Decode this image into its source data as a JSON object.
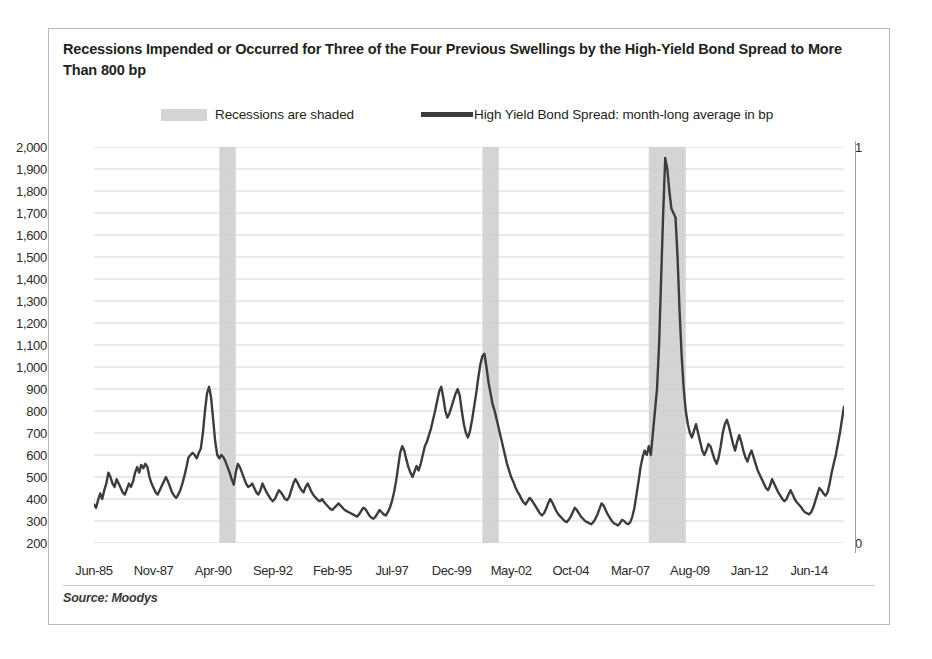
{
  "card": {
    "title": "Recessions Impended or Occurred for Three of the Four Previous Swellings by the High-Yield Bond Spread to More Than 800 bp",
    "source": "Source: Moodys"
  },
  "legend": {
    "shaded_label": "Recessions are shaded",
    "line_label": "High Yield Bond Spread: month-long average in bp",
    "shade_color": "#d4d4d4",
    "line_color": "#3c3c3c"
  },
  "chart_data": {
    "type": "line",
    "title": "Recessions Impended or Occurred for Three of the Four Previous Swellings by the High-Yield Bond Spread to More Than 800 bp",
    "xlabel": "",
    "ylabel": "",
    "ylim": [
      200,
      2000
    ],
    "ytick_step": 100,
    "yticks": [
      "2,000",
      "1,900",
      "1,800",
      "1,700",
      "1,600",
      "1,500",
      "1,400",
      "1,300",
      "1,200",
      "1,100",
      "1,000",
      "900",
      "800",
      "700",
      "600",
      "500",
      "400",
      "300",
      "200"
    ],
    "right_axis": {
      "ticks": [
        "1",
        "0"
      ],
      "lim": [
        0,
        1
      ]
    },
    "grid": "horizontal",
    "legend_position": "top",
    "x_start": "Jun-85",
    "x_end": "Nov-15",
    "xticks": [
      "Jun-85",
      "Nov-87",
      "Apr-90",
      "Sep-92",
      "Feb-95",
      "Jul-97",
      "Dec-99",
      "May-02",
      "Oct-04",
      "Mar-07",
      "Aug-09",
      "Jan-12",
      "Jun-14"
    ],
    "xtick_interval_months": 29,
    "series": [
      {
        "name": "High Yield Bond Spread: month-long average in bp",
        "unit": "bp",
        "color": "#3c3c3c",
        "values": [
          375,
          360,
          395,
          425,
          400,
          440,
          470,
          520,
          500,
          470,
          455,
          490,
          470,
          450,
          430,
          420,
          445,
          470,
          455,
          480,
          520,
          545,
          520,
          555,
          540,
          560,
          545,
          500,
          470,
          450,
          430,
          420,
          440,
          460,
          480,
          500,
          480,
          455,
          430,
          415,
          405,
          420,
          440,
          470,
          505,
          545,
          590,
          600,
          610,
          600,
          585,
          610,
          630,
          700,
          800,
          880,
          910,
          860,
          760,
          660,
          600,
          585,
          600,
          590,
          570,
          545,
          520,
          490,
          465,
          520,
          560,
          545,
          520,
          495,
          470,
          455,
          460,
          470,
          450,
          430,
          420,
          440,
          470,
          450,
          430,
          415,
          400,
          390,
          400,
          420,
          440,
          430,
          415,
          400,
          395,
          410,
          440,
          470,
          490,
          475,
          455,
          440,
          430,
          455,
          470,
          450,
          430,
          415,
          405,
          395,
          390,
          400,
          385,
          375,
          365,
          355,
          350,
          360,
          370,
          380,
          370,
          360,
          350,
          345,
          340,
          335,
          330,
          325,
          320,
          330,
          345,
          360,
          355,
          340,
          325,
          315,
          310,
          320,
          335,
          350,
          340,
          330,
          325,
          340,
          360,
          390,
          430,
          480,
          545,
          610,
          640,
          620,
          580,
          545,
          520,
          500,
          525,
          550,
          530,
          560,
          600,
          640,
          660,
          690,
          720,
          760,
          800,
          845,
          890,
          910,
          860,
          800,
          770,
          790,
          820,
          850,
          880,
          900,
          870,
          800,
          740,
          700,
          680,
          710,
          760,
          820,
          880,
          950,
          1010,
          1050,
          1060,
          1000,
          930,
          880,
          830,
          800,
          760,
          720,
          680,
          640,
          600,
          560,
          530,
          500,
          480,
          455,
          435,
          420,
          400,
          385,
          375,
          390,
          405,
          395,
          380,
          365,
          350,
          335,
          325,
          335,
          355,
          380,
          400,
          385,
          365,
          345,
          330,
          320,
          310,
          300,
          295,
          305,
          320,
          340,
          360,
          350,
          335,
          320,
          310,
          300,
          295,
          290,
          285,
          295,
          310,
          330,
          355,
          380,
          370,
          350,
          330,
          315,
          300,
          290,
          285,
          280,
          290,
          305,
          300,
          290,
          285,
          295,
          320,
          360,
          420,
          480,
          545,
          590,
          620,
          600,
          640,
          600,
          700,
          800,
          900,
          1100,
          1400,
          1700,
          1950,
          1900,
          1800,
          1720,
          1700,
          1680,
          1500,
          1250,
          1050,
          900,
          800,
          740,
          700,
          680,
          710,
          740,
          700,
          660,
          620,
          600,
          620,
          650,
          640,
          610,
          580,
          560,
          590,
          640,
          700,
          740,
          760,
          730,
          690,
          650,
          620,
          660,
          690,
          660,
          620,
          590,
          570,
          600,
          620,
          590,
          560,
          530,
          510,
          490,
          470,
          450,
          440,
          460,
          490,
          470,
          450,
          430,
          415,
          400,
          390,
          400,
          420,
          440,
          420,
          400,
          385,
          375,
          365,
          350,
          340,
          335,
          330,
          340,
          360,
          390,
          420,
          450,
          440,
          425,
          415,
          430,
          470,
          520,
          560,
          600,
          650,
          700,
          760,
          820
        ]
      }
    ],
    "recession_bands": [
      {
        "start": "Jul-90",
        "end": "Mar-91"
      },
      {
        "start": "Mar-01",
        "end": "Nov-01"
      },
      {
        "start": "Dec-07",
        "end": "Jun-09"
      }
    ],
    "annotations": [
      "Recessions are shaded"
    ]
  }
}
